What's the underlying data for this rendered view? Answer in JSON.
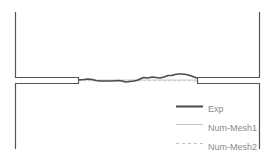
{
  "diagram": {
    "title": "",
    "colors": {
      "outline": "#555555",
      "exp": "#4a4a4a",
      "mesh1": "#bbbbbb",
      "mesh2": "#bbbbbb",
      "text": "#8a8a8a"
    }
  },
  "legend": {
    "items": [
      {
        "label": "Exp",
        "style": "thick-solid"
      },
      {
        "label": "Num-Mesh1",
        "style": "thin-solid"
      },
      {
        "label": "Num-Mesh2",
        "style": "dashed"
      }
    ]
  }
}
